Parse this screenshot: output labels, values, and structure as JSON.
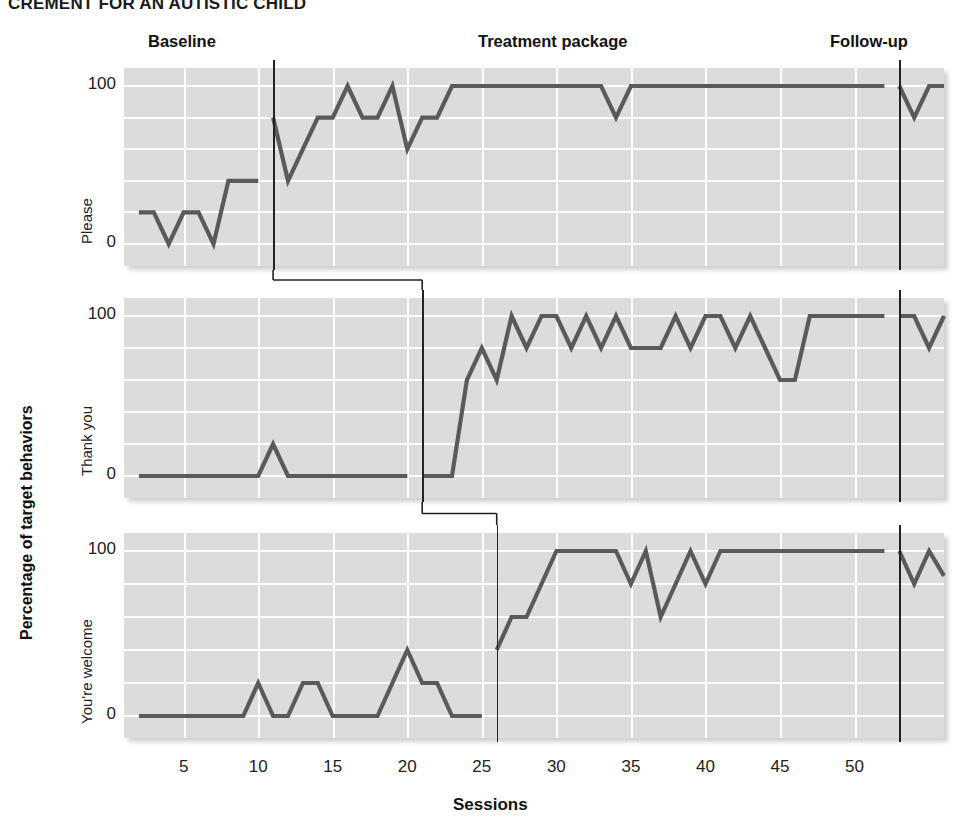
{
  "figure": {
    "title": "CREMENT FOR AN AUTISTIC CHILD",
    "xaxis_title": "Sessions",
    "yaxis_title": "Percentage of target behaviors"
  },
  "phase_labels": [
    {
      "name": "baseline",
      "text": "Baseline"
    },
    {
      "name": "treatment",
      "text": "Treatment package"
    },
    {
      "name": "followup",
      "text": "Follow-up"
    }
  ],
  "yticks": [
    "100",
    "0"
  ],
  "xticks": [
    "5",
    "10",
    "15",
    "20",
    "25",
    "30",
    "35",
    "40",
    "45",
    "50"
  ],
  "panels": [
    {
      "label": "Please"
    },
    {
      "label": "Thank you"
    },
    {
      "label": "You're welcome"
    }
  ],
  "colors": {
    "line": "#5a5a5a",
    "plot_background": "#dcdcdc",
    "gridline": "#fdfdfd",
    "phase_divider": "#222222",
    "text": "#1a1a1a"
  },
  "chart_data": {
    "type": "line",
    "title": "CREMENT FOR AN AUTISTIC CHILD",
    "xlabel": "Sessions",
    "ylabel": "Percentage of target behaviors",
    "xlim": [
      1,
      56
    ],
    "ylim": [
      0,
      100
    ],
    "grid": true,
    "legend_position": "none",
    "design": "multiple-baseline across behaviors",
    "phases": [
      {
        "label": "Baseline",
        "start": 1,
        "end": 10
      },
      {
        "label": "Treatment package",
        "start": 11,
        "end": 52
      },
      {
        "label": "Follow-up",
        "start": 53,
        "end": 56
      }
    ],
    "phase_change_sessions": [
      11,
      21,
      26
    ],
    "followup_line_session": 53,
    "yticks": [
      0,
      100
    ],
    "xticks": [
      5,
      10,
      15,
      20,
      25,
      30,
      35,
      40,
      45,
      50
    ],
    "series": [
      {
        "name": "Please",
        "intervention_session": 11,
        "baseline": {
          "x": [
            2,
            3,
            4,
            5,
            6,
            7,
            8,
            9,
            10
          ],
          "y": [
            20,
            20,
            0,
            20,
            20,
            0,
            40,
            40,
            40
          ]
        },
        "treatment": {
          "x": [
            11,
            12,
            13,
            14,
            15,
            16,
            17,
            18,
            19,
            20,
            21,
            22,
            23,
            24,
            25,
            26,
            27,
            28,
            29,
            30,
            31,
            32,
            33,
            34,
            35,
            36,
            37,
            38,
            39,
            40,
            41,
            42,
            43,
            44,
            45,
            46,
            47,
            48,
            49,
            50,
            51,
            52
          ],
          "y": [
            80,
            40,
            60,
            80,
            80,
            100,
            80,
            80,
            100,
            60,
            80,
            80,
            100,
            100,
            100,
            100,
            100,
            100,
            100,
            100,
            100,
            100,
            100,
            80,
            100,
            100,
            100,
            100,
            100,
            100,
            100,
            100,
            100,
            100,
            100,
            100,
            100,
            100,
            100,
            100,
            100,
            100
          ]
        },
        "followup": {
          "x": [
            53,
            54,
            55,
            56
          ],
          "y": [
            100,
            80,
            100,
            100
          ]
        }
      },
      {
        "name": "Thank you",
        "intervention_session": 21,
        "baseline": {
          "x": [
            2,
            3,
            4,
            5,
            6,
            7,
            8,
            9,
            10,
            11,
            12,
            13,
            14,
            15,
            16,
            17,
            18,
            19,
            20
          ],
          "y": [
            0,
            0,
            0,
            0,
            0,
            0,
            0,
            0,
            0,
            20,
            0,
            0,
            0,
            0,
            0,
            0,
            0,
            0,
            0
          ]
        },
        "treatment": {
          "x": [
            21,
            22,
            23,
            24,
            25,
            26,
            27,
            28,
            29,
            30,
            31,
            32,
            33,
            34,
            35,
            36,
            37,
            38,
            39,
            40,
            41,
            42,
            43,
            44,
            45,
            46,
            47,
            48,
            49,
            50,
            51,
            52
          ],
          "y": [
            0,
            0,
            0,
            60,
            80,
            60,
            100,
            80,
            100,
            100,
            80,
            100,
            80,
            100,
            80,
            80,
            80,
            100,
            80,
            100,
            100,
            80,
            100,
            80,
            60,
            60,
            100,
            100,
            100,
            100,
            100,
            100
          ]
        },
        "followup": {
          "x": [
            53,
            54,
            55,
            56
          ],
          "y": [
            100,
            100,
            80,
            100
          ]
        }
      },
      {
        "name": "You're welcome",
        "intervention_session": 26,
        "baseline": {
          "x": [
            2,
            3,
            4,
            5,
            6,
            7,
            8,
            9,
            10,
            11,
            12,
            13,
            14,
            15,
            16,
            17,
            18,
            19,
            20,
            21,
            22,
            23,
            24,
            25
          ],
          "y": [
            0,
            0,
            0,
            0,
            0,
            0,
            0,
            0,
            20,
            0,
            0,
            20,
            20,
            0,
            0,
            0,
            0,
            20,
            40,
            20,
            20,
            0,
            0,
            0
          ]
        },
        "treatment": {
          "x": [
            26,
            27,
            28,
            29,
            30,
            31,
            32,
            33,
            34,
            35,
            36,
            37,
            38,
            39,
            40,
            41,
            42,
            43,
            44,
            45,
            46,
            47,
            48,
            49,
            50,
            51,
            52
          ],
          "y": [
            40,
            60,
            60,
            80,
            100,
            100,
            100,
            100,
            100,
            80,
            100,
            60,
            80,
            100,
            80,
            100,
            100,
            100,
            100,
            100,
            100,
            100,
            100,
            100,
            100,
            100,
            100
          ]
        },
        "followup": {
          "x": [
            53,
            54,
            55,
            56
          ],
          "y": [
            100,
            80,
            100,
            85
          ]
        }
      }
    ]
  }
}
